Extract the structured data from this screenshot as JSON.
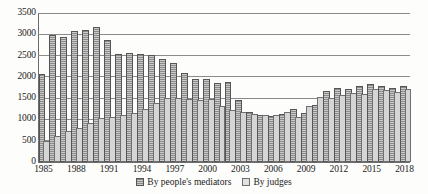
{
  "chart_data": {
    "type": "bar",
    "title": "",
    "subtitle": "",
    "xlabel": "",
    "ylabel": "",
    "ylim": [
      0,
      3500
    ],
    "ytick_step": 500,
    "yticks": [
      "3500",
      "3000",
      "2500",
      "2000",
      "1500",
      "1000",
      "500",
      "0"
    ],
    "grid": true,
    "legend_position": "bottom-center",
    "categories": [
      "1985",
      "1986",
      "1987",
      "1988",
      "1989",
      "1990",
      "1991",
      "1992",
      "1993",
      "1994",
      "1995",
      "1996",
      "1997",
      "1998",
      "1999",
      "2000",
      "2001",
      "2002",
      "2003",
      "2004",
      "2005",
      "2006",
      "2007",
      "2008",
      "2009",
      "2010",
      "2011",
      "2012",
      "2013",
      "2014",
      "2015",
      "2016",
      "2017",
      "2018"
    ],
    "xtick_labels": [
      "1985",
      "1988",
      "1991",
      "1994",
      "1997",
      "2000",
      "2003",
      "2006",
      "2009",
      "2012",
      "2015",
      "2018"
    ],
    "series": [
      {
        "name": "By people's mediators",
        "color": "#8a8a8a",
        "values": [
          2010,
          2930,
          2890,
          3020,
          3060,
          3120,
          2820,
          2500,
          2510,
          2500,
          2460,
          2370,
          2270,
          2040,
          1900,
          1900,
          1820,
          1830,
          1420,
          1130,
          1060,
          1040,
          1070,
          1200,
          1110,
          1290,
          1610,
          1700,
          1660,
          1750,
          1790,
          1730,
          1680,
          1750
        ]
      },
      {
        "name": "By judges",
        "color": "#d5d5d5",
        "values": [
          450,
          560,
          670,
          760,
          880,
          990,
          1000,
          1060,
          1110,
          1200,
          1340,
          1450,
          1450,
          1430,
          1420,
          1430,
          1270,
          1180,
          1130,
          1070,
          1050,
          1060,
          1120,
          1020,
          1280,
          1480,
          1450,
          1530,
          1570,
          1540,
          1660,
          1640,
          1600,
          1660
        ]
      }
    ]
  }
}
